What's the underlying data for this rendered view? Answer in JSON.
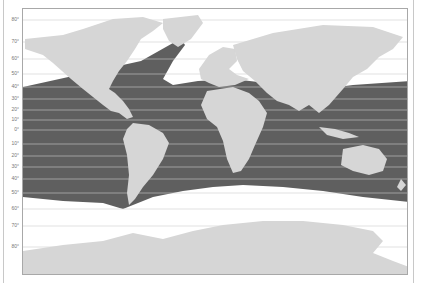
{
  "map": {
    "type": "species-range-map",
    "projection": "equirectangular-world",
    "colors": {
      "range": "#5f5f5f",
      "land": "#d6d6d6",
      "ocean": "#ffffff",
      "gridline": "#cfcfcf",
      "frame": "#a8a8a8"
    },
    "latitude_labels": [
      {
        "text": "80°",
        "y": 19
      },
      {
        "text": "70°",
        "y": 41
      },
      {
        "text": "60°",
        "y": 58
      },
      {
        "text": "50°",
        "y": 73
      },
      {
        "text": "40°",
        "y": 86
      },
      {
        "text": "30°",
        "y": 98
      },
      {
        "text": "20°",
        "y": 109
      },
      {
        "text": "10°",
        "y": 119
      },
      {
        "text": "0°",
        "y": 129
      },
      {
        "text": "10°",
        "y": 143
      },
      {
        "text": "20°",
        "y": 155
      },
      {
        "text": "30°",
        "y": 166
      },
      {
        "text": "40°",
        "y": 178
      },
      {
        "text": "50°",
        "y": 192
      },
      {
        "text": "60°",
        "y": 208
      },
      {
        "text": "70°",
        "y": 225
      },
      {
        "text": "80°",
        "y": 246
      }
    ],
    "range_description": "Shaded distribution across tropical and temperate oceans, roughly 45°N to 45–55°S, extending north into the North Atlantic to ~70°N off Norway"
  }
}
